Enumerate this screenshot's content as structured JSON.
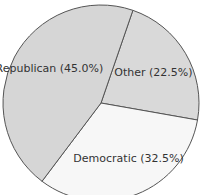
{
  "chart_data": {
    "type": "pie",
    "title": "",
    "start_angle_deg_clockwise_from_top": 19,
    "direction": "clockwise",
    "slices": [
      {
        "label": "Other",
        "value": 22.5,
        "display": "Other (22.5%)",
        "color": "#d9d9d9"
      },
      {
        "label": "Democratic",
        "value": 32.5,
        "display": "Democratic (32.5%)",
        "color": "#f7f7f7"
      },
      {
        "label": "Republican",
        "value": 45.0,
        "display": "Republican (45.0%)",
        "color": "#d6d6d6"
      }
    ],
    "legend": "none"
  }
}
